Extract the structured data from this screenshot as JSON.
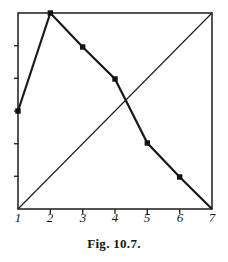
{
  "figure": {
    "caption": "Fig. 10.7.",
    "line_color": "#1a1a1a",
    "frame_color": "#2a2a2a",
    "background": "#ffffff"
  },
  "axes": {
    "x_tick_labels": [
      "1",
      "2",
      "3",
      "4",
      "5",
      "6",
      "7"
    ],
    "y_tick_count": 6,
    "frame": {
      "left": 18,
      "right": 212,
      "top": 13,
      "bottom": 209
    }
  },
  "chart_data": {
    "type": "line",
    "title": "Fig. 10.7.",
    "xlabel": "",
    "ylabel": "",
    "xlim": [
      1,
      7
    ],
    "ylim": [
      0,
      6
    ],
    "grid": false,
    "legend": "none",
    "x": [
      1,
      2,
      3,
      4,
      5,
      6,
      7
    ],
    "series": [
      {
        "name": "descending-curve",
        "style": "thick-with-markers",
        "markers": true,
        "values": [
          3.0,
          6.0,
          4.96,
          3.98,
          2.02,
          0.98,
          0.0
        ]
      },
      {
        "name": "ascending-line",
        "style": "thin-straight",
        "markers": false,
        "values": [
          0.0,
          1.0,
          2.0,
          3.0,
          4.0,
          5.0,
          6.0
        ]
      }
    ],
    "annotations": [
      {
        "text": "peak at x = 2",
        "x": 2,
        "y": 6.0
      },
      {
        "text": "crossing near x = 4.4",
        "x": 4.4,
        "y": 3.4
      }
    ]
  }
}
